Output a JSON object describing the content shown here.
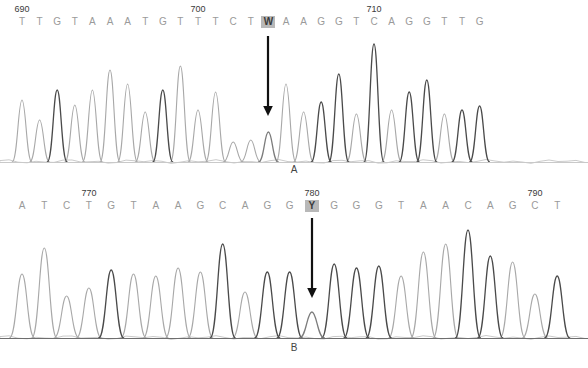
{
  "figure": {
    "type": "sanger-sequencing-chromatogram",
    "background": "#ffffff",
    "trace_colors": {
      "light_gray": "#a8a8a8",
      "dark_gray": "#4a4a4a",
      "baseline": "#c9c9c9",
      "arrow": "#111111",
      "highlight_bg": "#b8b8b8",
      "base_text": "#9a9a9a",
      "number_text": "#3a3a3a"
    }
  },
  "panels": [
    {
      "id": "A",
      "label": "A",
      "sequence": "TTGTAAATGTTTCTWAAGGTCAGGTTG",
      "bases": [
        "T",
        "T",
        "G",
        "T",
        "A",
        "A",
        "A",
        "T",
        "G",
        "T",
        "T",
        "T",
        "C",
        "T",
        "W",
        "A",
        "A",
        "G",
        "G",
        "T",
        "C",
        "A",
        "G",
        "G",
        "T",
        "T",
        "G"
      ],
      "highlight_index": 14,
      "highlight_base": "W",
      "position_labels": [
        {
          "index": 0,
          "value": "690"
        },
        {
          "index": 10,
          "value": "700"
        },
        {
          "index": 20,
          "value": "710"
        }
      ],
      "arrow_index": 14,
      "arrow_note": "heterozygous W (A/T) at position 704",
      "peak_shades": [
        "L",
        "L",
        "D",
        "L",
        "L",
        "L",
        "L",
        "L",
        "D",
        "L",
        "L",
        "L",
        "L",
        "L",
        "M",
        "L",
        "L",
        "D",
        "D",
        "L",
        "D",
        "L",
        "D",
        "D",
        "L",
        "D",
        "D"
      ],
      "peak_heights": [
        62,
        42,
        72,
        57,
        72,
        92,
        78,
        50,
        72,
        96,
        52,
        70,
        20,
        22,
        30,
        78,
        50,
        60,
        88,
        48,
        118,
        52,
        70,
        82,
        48,
        52,
        56
      ]
    },
    {
      "id": "B",
      "label": "B",
      "sequence": "ATCTGTAAGCAGGYGGGTAACAGCT",
      "bases": [
        "A",
        "T",
        "C",
        "T",
        "G",
        "T",
        "A",
        "A",
        "G",
        "C",
        "A",
        "G",
        "G",
        "Y",
        "G",
        "G",
        "G",
        "T",
        "A",
        "A",
        "C",
        "A",
        "G",
        "C",
        "T"
      ],
      "highlight_index": 13,
      "highlight_base": "Y",
      "position_labels": [
        {
          "index": 3,
          "value": "770"
        },
        {
          "index": 13,
          "value": "780"
        },
        {
          "index": 23,
          "value": "790"
        }
      ],
      "arrow_index": 13,
      "arrow_note": "heterozygous Y (C/T) at position 780",
      "peak_shades": [
        "L",
        "L",
        "L",
        "L",
        "D",
        "L",
        "L",
        "L",
        "L",
        "D",
        "L",
        "D",
        "D",
        "M",
        "D",
        "D",
        "D",
        "L",
        "L",
        "L",
        "D",
        "D",
        "L",
        "L",
        "D"
      ],
      "peak_heights": [
        64,
        90,
        42,
        50,
        68,
        64,
        62,
        70,
        66,
        94,
        46,
        66,
        66,
        26,
        74,
        70,
        72,
        62,
        86,
        94,
        108,
        82,
        76,
        44,
        62
      ]
    }
  ],
  "chart_data": {
    "type": "line",
    "title": "",
    "xlabel": "",
    "ylabel": "",
    "series": [
      {
        "name": "Panel A trace",
        "categories": [
          "T",
          "T",
          "G",
          "T",
          "A",
          "A",
          "A",
          "T",
          "G",
          "T",
          "T",
          "T",
          "C",
          "T",
          "W",
          "A",
          "A",
          "G",
          "G",
          "T",
          "C",
          "A",
          "G",
          "G",
          "T",
          "T",
          "G"
        ],
        "values": [
          62,
          42,
          72,
          57,
          72,
          92,
          78,
          50,
          72,
          96,
          52,
          70,
          20,
          22,
          30,
          78,
          50,
          60,
          88,
          48,
          118,
          52,
          70,
          82,
          48,
          52,
          56
        ]
      },
      {
        "name": "Panel B trace",
        "categories": [
          "A",
          "T",
          "C",
          "T",
          "G",
          "T",
          "A",
          "A",
          "G",
          "C",
          "A",
          "G",
          "G",
          "Y",
          "G",
          "G",
          "G",
          "T",
          "A",
          "A",
          "C",
          "A",
          "G",
          "C",
          "T"
        ],
        "values": [
          64,
          90,
          42,
          50,
          68,
          64,
          62,
          70,
          66,
          94,
          46,
          66,
          66,
          26,
          74,
          70,
          72,
          62,
          86,
          94,
          108,
          82,
          76,
          44,
          62
        ]
      }
    ]
  }
}
